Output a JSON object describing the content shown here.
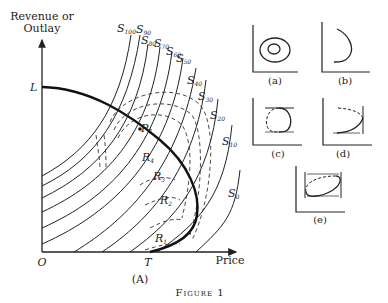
{
  "main_chart": {
    "y_axis_label_line1": "Revenue or",
    "y_axis_label_line2": "Outlay",
    "x_axis_label": "Price",
    "origin_label": "O",
    "point_L": "L",
    "point_T": "T",
    "point_P": "P",
    "panel_label": "(A)",
    "curve_labels": [
      {
        "base": "S",
        "sub": "100"
      },
      {
        "base": "S",
        "sub": "90"
      },
      {
        "base": "S",
        "sub": "80"
      },
      {
        "base": "S",
        "sub": "70"
      },
      {
        "base": "S",
        "sub": "60"
      },
      {
        "base": "S",
        "sub": "50"
      },
      {
        "base": "S",
        "sub": "40"
      },
      {
        "base": "S",
        "sub": "30"
      },
      {
        "base": "S",
        "sub": "20"
      },
      {
        "base": "S",
        "sub": "10"
      },
      {
        "base": "S",
        "sub": "0"
      }
    ],
    "r_labels": [
      {
        "base": "R",
        "sub": "4"
      },
      {
        "base": "R",
        "sub": "3"
      },
      {
        "base": "R",
        "sub": "2"
      },
      {
        "base": "R",
        "sub": "1"
      }
    ]
  },
  "subfigures": [
    {
      "label": "(a)"
    },
    {
      "label": "(b)"
    },
    {
      "label": "(c)"
    },
    {
      "label": "(d)"
    },
    {
      "label": "(e)"
    }
  ],
  "caption": "Figure 1"
}
